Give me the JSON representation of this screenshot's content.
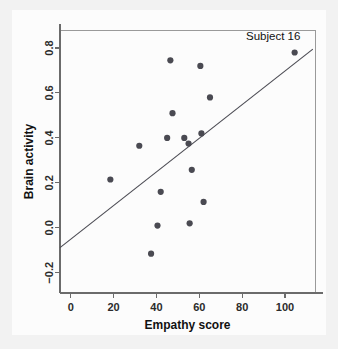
{
  "figure": {
    "background_color": "#f2f2f2",
    "panel_color": "#fcfcfc",
    "point_color": "#4a4a52",
    "line_color": "#4a4a52",
    "axis_color": "#6b6b6b"
  },
  "chart_data": {
    "type": "scatter",
    "title": "",
    "xlabel": "Empathy score",
    "ylabel": "Brain activity",
    "xlim": [
      -5,
      114
    ],
    "ylim": [
      -0.29,
      0.88
    ],
    "grid": false,
    "legend": null,
    "xticks": [
      0,
      20,
      40,
      60,
      80,
      100
    ],
    "xtick_labels": [
      "0",
      "20",
      "40",
      "60",
      "80",
      "100"
    ],
    "yticks": [
      -0.2,
      0.0,
      0.2,
      0.4,
      0.6,
      0.8
    ],
    "ytick_labels": [
      "-0.2",
      "0.0",
      "0.2",
      "0.4",
      "0.6",
      "0.8"
    ],
    "points": [
      {
        "x": 18.5,
        "y": 0.215
      },
      {
        "x": 32.0,
        "y": 0.365
      },
      {
        "x": 37.5,
        "y": -0.115
      },
      {
        "x": 40.5,
        "y": 0.01
      },
      {
        "x": 42.0,
        "y": 0.16
      },
      {
        "x": 45.0,
        "y": 0.4
      },
      {
        "x": 46.5,
        "y": 0.745
      },
      {
        "x": 47.5,
        "y": 0.51
      },
      {
        "x": 53.0,
        "y": 0.4
      },
      {
        "x": 55.0,
        "y": 0.375
      },
      {
        "x": 55.5,
        "y": 0.02
      },
      {
        "x": 56.5,
        "y": 0.258
      },
      {
        "x": 60.5,
        "y": 0.72
      },
      {
        "x": 61.0,
        "y": 0.42
      },
      {
        "x": 62.0,
        "y": 0.115
      },
      {
        "x": 65.0,
        "y": 0.58
      },
      {
        "x": 104.5,
        "y": 0.78
      }
    ],
    "fit_line": {
      "x_start": -5,
      "y_start": -0.088,
      "x_end": 113,
      "y_end": 0.795
    },
    "annotations": [
      {
        "text": "Subject 16",
        "x": 104.5,
        "y": 0.78,
        "dx": -10,
        "dy": 0.055
      }
    ]
  }
}
